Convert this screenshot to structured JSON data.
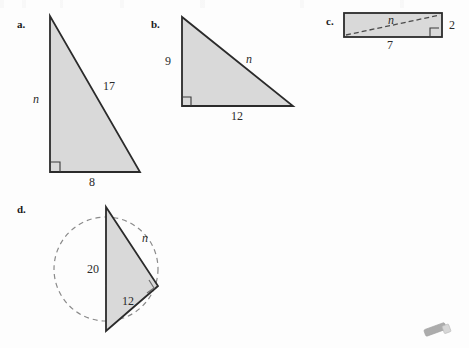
{
  "page": {
    "width": 469,
    "height": 348,
    "background_color": "#fdfdfd",
    "shape_fill_color": "#d9d9d9",
    "shape_stroke_color": "#2b2b2b",
    "dashed_stroke_color": "#8a8a8a",
    "text_color": "#1b1b1b"
  },
  "problems": [
    {
      "id": "a",
      "label": "a.",
      "figure": "right-triangle",
      "description": "Right triangle with vertical leg on the left, right angle at bottom-left",
      "labels": {
        "leg_vertical": "n",
        "hypotenuse": "17",
        "leg_horizontal": "8"
      }
    },
    {
      "id": "b",
      "label": "b.",
      "figure": "right-triangle",
      "description": "Right triangle with vertical leg on the left, right angle at bottom-left",
      "labels": {
        "leg_vertical": "9",
        "hypotenuse": "n",
        "leg_horizontal": "12"
      }
    },
    {
      "id": "c",
      "label": "c.",
      "figure": "rectangle-with-diagonal",
      "description": "Rectangle with a dashed diagonal from bottom-left to top-right, right angle at bottom-right",
      "labels": {
        "diagonal": "n",
        "height": "2",
        "width": "7"
      }
    },
    {
      "id": "d",
      "label": "d.",
      "figure": "triangle-in-circle",
      "description": "Right triangle inscribed in a dashed circle with the diameter as one side",
      "labels": {
        "diameter": "20",
        "upper_side": "n",
        "lower_side": "12"
      }
    }
  ],
  "decorations": {
    "eraser": {
      "name": "eraser-smudge",
      "color": "#8e8e8e"
    }
  }
}
